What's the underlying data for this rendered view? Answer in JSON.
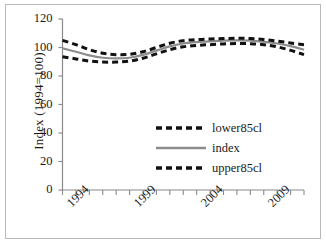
{
  "chart_data": {
    "type": "line",
    "title": "",
    "xlabel": "",
    "ylabel": "Index (1994=100)",
    "ylim": [
      0,
      120
    ],
    "ytick_labels": [
      "0",
      "20",
      "40",
      "60",
      "80",
      "100",
      "120"
    ],
    "yticks": [
      0,
      20,
      40,
      60,
      80,
      100,
      120
    ],
    "xlim": [
      1993,
      2011
    ],
    "xticks": [
      1993,
      1994,
      1995,
      1996,
      1997,
      1998,
      1999,
      2000,
      2001,
      2002,
      2003,
      2004,
      2005,
      2006,
      2007,
      2008,
      2009,
      2010,
      2011
    ],
    "xtick_labels": [
      "1994",
      "1999",
      "2004",
      "2009"
    ],
    "xtick_label_years": [
      1994,
      1999,
      2004,
      2009
    ],
    "grid": false,
    "legend_position": "center-right-inside",
    "x": [
      1993,
      1994,
      1995,
      1996,
      1997,
      1998,
      1999,
      2000,
      2001,
      2002,
      2003,
      2004,
      2005,
      2006,
      2007,
      2008,
      2009,
      2010,
      2011
    ],
    "series": [
      {
        "name": "lower85cl",
        "style": "dashed",
        "color": "#111111",
        "values": [
          93.5,
          92.0,
          90.5,
          89.8,
          89.8,
          90.5,
          92.5,
          95.5,
          98.5,
          100.5,
          101.5,
          102.0,
          102.5,
          102.8,
          102.7,
          102.0,
          100.5,
          98.0,
          95.0
        ]
      },
      {
        "name": "index",
        "style": "solid",
        "color": "#8c8c8c",
        "values": [
          99.5,
          97.0,
          94.5,
          92.8,
          92.3,
          92.8,
          94.8,
          97.8,
          100.8,
          102.8,
          103.8,
          104.3,
          104.8,
          105.0,
          104.8,
          104.0,
          102.8,
          101.0,
          98.5
        ]
      },
      {
        "name": "upper85cl",
        "style": "dashed",
        "color": "#111111",
        "values": [
          105.0,
          102.0,
          98.5,
          96.0,
          95.0,
          95.2,
          97.0,
          100.0,
          103.0,
          104.8,
          105.6,
          106.0,
          106.3,
          106.5,
          106.3,
          105.6,
          104.5,
          103.2,
          102.0
        ]
      }
    ],
    "legend": [
      {
        "label": "lower85cl",
        "style": "dashed",
        "color": "#111111"
      },
      {
        "label": "index",
        "style": "solid",
        "color": "#8c8c8c"
      },
      {
        "label": "upper85cl",
        "style": "dashed",
        "color": "#111111"
      }
    ]
  },
  "axis_colors": {
    "axis_line": "#8a8a8a",
    "tick": "#8a8a8a",
    "text": "#1a1a1a",
    "frame": "#b9b9b9"
  }
}
